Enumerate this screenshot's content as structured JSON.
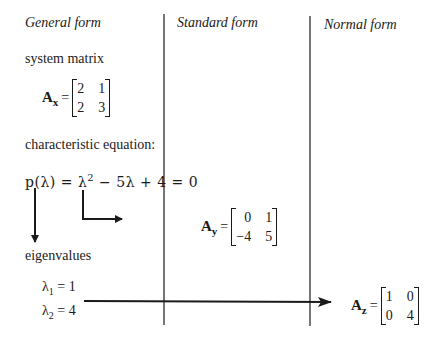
{
  "columns": {
    "general": {
      "heading": "General form"
    },
    "standard": {
      "heading": "Standard form"
    },
    "normal": {
      "heading": "Normal form"
    }
  },
  "general": {
    "system_matrix_label": "system matrix",
    "matrix": {
      "name": "A",
      "subscript": "x",
      "rows": [
        [
          "2",
          "1"
        ],
        [
          "2",
          "3"
        ]
      ]
    },
    "char_eq_label": "characteristic equation:",
    "char_eq": "p(λ) = λ² − 5λ + 4 = 0",
    "char_eq_parts": {
      "lhs": "p(λ)",
      "eq1": "=",
      "lambda": "λ",
      "power": "2",
      "rest": "−  5λ + 4  =  0"
    },
    "eigenvalues_label": "eigenvalues",
    "eigenvalues": [
      {
        "symbol": "λ",
        "index": "1",
        "value": "= 1"
      },
      {
        "symbol": "λ",
        "index": "2",
        "value": "= 4"
      }
    ]
  },
  "standard": {
    "matrix": {
      "name": "A",
      "subscript": "y",
      "rows": [
        [
          "0",
          "1"
        ],
        [
          "−4",
          "5"
        ]
      ]
    }
  },
  "normal": {
    "matrix": {
      "name": "A",
      "subscript": "z",
      "rows": [
        [
          "1",
          "0"
        ],
        [
          "0",
          "4"
        ]
      ]
    }
  },
  "colors": {
    "ink": "#1a1a1a",
    "background": "#ffffff"
  }
}
